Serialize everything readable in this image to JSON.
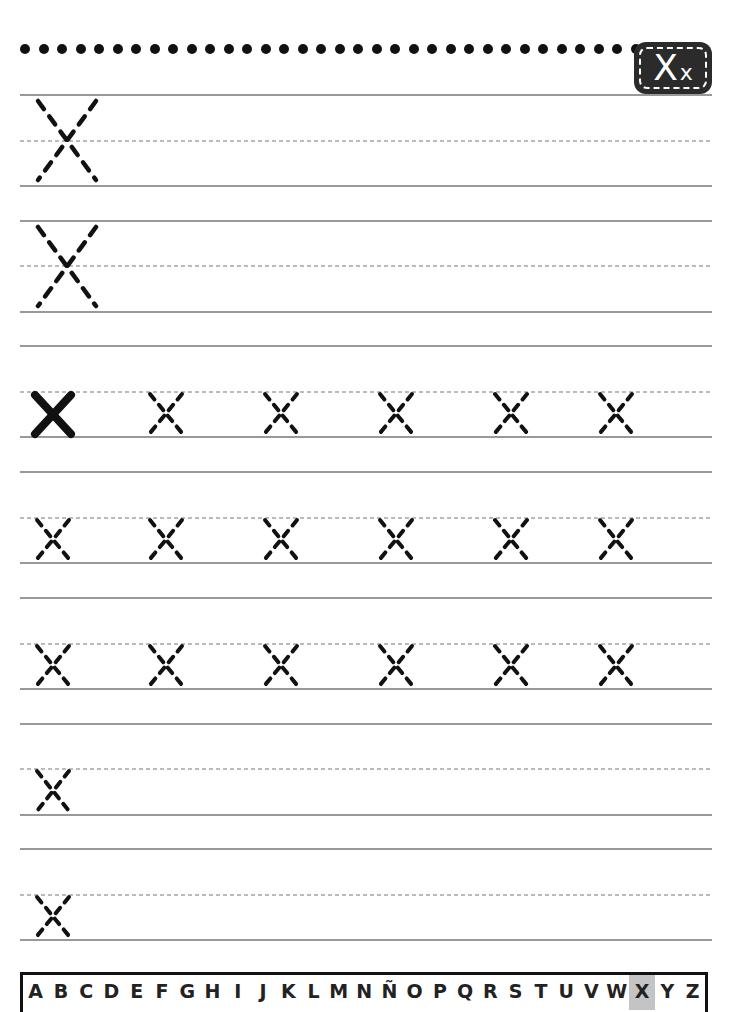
{
  "header": {
    "dot_count": 34,
    "badge": {
      "upper": "X",
      "lower": "x"
    }
  },
  "colors": {
    "ink": "#111111",
    "rule": "#777777",
    "badge_bg": "#2b2b2b",
    "highlight": "#c4c4c4"
  },
  "rows": [
    {
      "top": 95,
      "mid": 141,
      "bottom": 186,
      "letters": [
        {
          "type": "big-dashed",
          "x": 38
        }
      ]
    },
    {
      "top": 221,
      "mid": 266,
      "bottom": 312,
      "letters": [
        {
          "type": "big-dashed",
          "x": 38
        }
      ]
    },
    {
      "top": 346,
      "mid": 392,
      "bottom": 437,
      "letters": [
        {
          "type": "solid",
          "x": 35
        },
        {
          "type": "small-dashed",
          "x": 150
        },
        {
          "type": "small-dashed",
          "x": 265
        },
        {
          "type": "small-dashed",
          "x": 380
        },
        {
          "type": "small-dashed",
          "x": 495
        },
        {
          "type": "small-dashed",
          "x": 600
        }
      ]
    },
    {
      "top": 472,
      "mid": 518,
      "bottom": 563,
      "letters": [
        {
          "type": "small-dashed",
          "x": 37
        },
        {
          "type": "small-dashed",
          "x": 150
        },
        {
          "type": "small-dashed",
          "x": 265
        },
        {
          "type": "small-dashed",
          "x": 380
        },
        {
          "type": "small-dashed",
          "x": 495
        },
        {
          "type": "small-dashed",
          "x": 600
        }
      ]
    },
    {
      "top": 598,
      "mid": 644,
      "bottom": 689,
      "letters": [
        {
          "type": "small-dashed",
          "x": 37
        },
        {
          "type": "small-dashed",
          "x": 150
        },
        {
          "type": "small-dashed",
          "x": 265
        },
        {
          "type": "small-dashed",
          "x": 380
        },
        {
          "type": "small-dashed",
          "x": 495
        },
        {
          "type": "small-dashed",
          "x": 600
        }
      ]
    },
    {
      "top": 724,
      "mid": 769,
      "bottom": 815,
      "letters": [
        {
          "type": "small-dashed",
          "x": 37
        }
      ]
    },
    {
      "top": 849,
      "mid": 895,
      "bottom": 940,
      "letters": [
        {
          "type": "small-dashed",
          "x": 37
        }
      ]
    }
  ],
  "alphabet": {
    "letters": [
      "A",
      "B",
      "C",
      "D",
      "E",
      "F",
      "G",
      "H",
      "I",
      "J",
      "K",
      "L",
      "M",
      "N",
      "Ñ",
      "O",
      "P",
      "Q",
      "R",
      "S",
      "T",
      "U",
      "V",
      "W",
      "X",
      "Y",
      "Z"
    ],
    "active": "X"
  }
}
